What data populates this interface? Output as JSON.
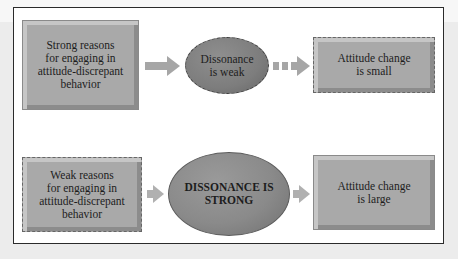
{
  "diagram": {
    "colors": {
      "box_fill": "#a9a9a9",
      "ellipse_fill": "#8a8a8a",
      "arrow": "#a6a6a6",
      "frame_border": "#2b2b2b",
      "background": "#ececec"
    },
    "rows": [
      {
        "cause": {
          "text": "Strong reasons for engaging in attitude-discrepant behavior",
          "line1": "Strong reasons",
          "line2": "for engaging in",
          "line3": "attitude-discrepant",
          "line4": "behavior",
          "border": "solid"
        },
        "arrow1": {
          "style": "solid"
        },
        "dissonance": {
          "line1": "Dissonance",
          "line2": "is weak",
          "border": "dashed"
        },
        "arrow2": {
          "style": "dotted"
        },
        "outcome": {
          "line1": "Attitude change",
          "line2": "is small",
          "border": "dashed"
        }
      },
      {
        "cause": {
          "text": "Weak reasons for engaging in attitude-discrepant behavior",
          "line1": "Weak reasons",
          "line2": "for engaging in",
          "line3": "attitude-discrepant",
          "line4": "behavior",
          "border": "dashed"
        },
        "arrow1": {
          "style": "solid-short"
        },
        "dissonance": {
          "line1": "DISSONANCE IS",
          "line2": "STRONG",
          "border": "solid"
        },
        "arrow2": {
          "style": "solid-short"
        },
        "outcome": {
          "line1": "Attitude change",
          "line2": "is large",
          "border": "solid"
        }
      }
    ]
  }
}
